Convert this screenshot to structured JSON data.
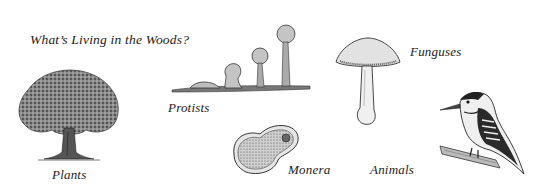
{
  "title": "What’s Living in the Woods?",
  "labels": {
    "plants": "Plants",
    "protists": "Protists",
    "fungi": "Funguses",
    "monera": "Monera",
    "animals": "Animals"
  },
  "illustrations": [
    {
      "kingdom": "plants",
      "icon": "tree-icon"
    },
    {
      "kingdom": "protists",
      "icon": "slime-mold-icon"
    },
    {
      "kingdom": "fungi",
      "icon": "mushroom-icon"
    },
    {
      "kingdom": "monera",
      "icon": "bacteria-cell-icon"
    },
    {
      "kingdom": "animals",
      "icon": "woodpecker-icon"
    }
  ],
  "colors": {
    "ink": "#1a1a1a",
    "shade": "#9a9a9a",
    "light": "#d8d8d8",
    "background": "#ffffff"
  }
}
